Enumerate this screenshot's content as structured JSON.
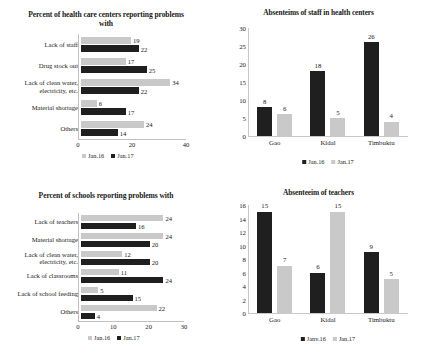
{
  "chart_data": [
    {
      "id": "health-centers-problems",
      "type": "bar",
      "orientation": "horizontal",
      "title": "Percent of health care centers reporting problems with",
      "categories": [
        "Lack of staff",
        "Drug stock out",
        "Lack of clean water, electricity, etc.",
        "Material shortage",
        "Others"
      ],
      "series": [
        {
          "name": "Jan.16",
          "color": "#c9c9c9",
          "values": [
            19,
            17,
            34,
            6,
            24
          ]
        },
        {
          "name": "Jan.17",
          "color": "#1f1f1f",
          "values": [
            22,
            25,
            22,
            17,
            14
          ]
        }
      ],
      "xlabel": "",
      "ylabel": "",
      "xlim": [
        0,
        40
      ],
      "xticks": [
        0,
        20,
        40
      ],
      "grid": false,
      "legend_position": "bottom"
    },
    {
      "id": "absenteeism-staff-health-centers",
      "type": "bar",
      "orientation": "vertical",
      "title": "Absenteims of staff in health centers",
      "categories": [
        "Gao",
        "Kidal",
        "Timbuktu"
      ],
      "series": [
        {
          "name": "Jan.16",
          "color": "#1f1f1f",
          "values": [
            8,
            18,
            26
          ]
        },
        {
          "name": "Jan.17",
          "color": "#c9c9c9",
          "values": [
            6,
            5,
            4
          ]
        }
      ],
      "xlabel": "",
      "ylabel": "",
      "ylim": [
        0,
        30
      ],
      "yticks": [
        0,
        5,
        10,
        15,
        20,
        25,
        30
      ],
      "grid": false,
      "legend_position": "bottom"
    },
    {
      "id": "schools-problems",
      "type": "bar",
      "orientation": "horizontal",
      "title": "Percent of schools reporting problems with",
      "categories": [
        "Lack of teachers",
        "Material shortage",
        "Lack of clean water, electricity, etc.",
        "Lack of classrooms",
        "Lack of school feeding",
        "Others"
      ],
      "series": [
        {
          "name": "Jan.16",
          "color": "#c9c9c9",
          "values": [
            24,
            24,
            12,
            11,
            5,
            22
          ]
        },
        {
          "name": "Jan.17",
          "color": "#1f1f1f",
          "values": [
            16,
            20,
            20,
            24,
            15,
            4
          ]
        }
      ],
      "xlabel": "",
      "ylabel": "",
      "xlim": [
        0,
        30
      ],
      "xticks": [
        0,
        10,
        20,
        30
      ],
      "grid": false,
      "legend_position": "bottom"
    },
    {
      "id": "absenteeism-teachers",
      "type": "bar",
      "orientation": "vertical",
      "title": "Absenteeim of teachers",
      "categories": [
        "Gao",
        "Kidal",
        "Timbuktu"
      ],
      "series": [
        {
          "name": "Janv.16",
          "color": "#1f1f1f",
          "values": [
            15,
            6,
            9
          ]
        },
        {
          "name": "Jan.17",
          "color": "#c9c9c9",
          "values": [
            7,
            15,
            5
          ]
        }
      ],
      "xlabel": "",
      "ylabel": "",
      "ylim": [
        0,
        16
      ],
      "yticks": [
        0,
        2,
        4,
        6,
        8,
        10,
        12,
        14,
        16
      ],
      "grid": false,
      "legend_position": "bottom"
    }
  ]
}
